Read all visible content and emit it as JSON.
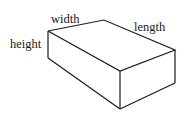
{
  "diagram": {
    "title": "",
    "shape": "rectangular-prism",
    "labels": {
      "width": "width",
      "length": "length",
      "height": "height"
    },
    "colors": {
      "stroke": "#1a1a1a",
      "background": "#ffffff"
    }
  }
}
